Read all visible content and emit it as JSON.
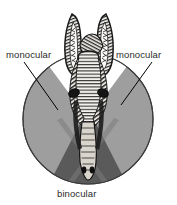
{
  "figure": {
    "type": "diagram"
  },
  "labels": {
    "monocular_left": "monocular",
    "monocular_right": "monocular",
    "binocular": "binocular"
  },
  "colors": {
    "background": "#ffffff",
    "monocular_zone": "#9e9e9e",
    "binocular_zone": "#5a5a5a",
    "outline": "#3a3a3a",
    "leader_line": "#000000",
    "label_text": "#2b2b2b",
    "head_ink": "#1a1a1a",
    "head_paper": "#f2f0ec"
  },
  "geometry": {
    "circle_center_x": 88,
    "circle_center_y": 119,
    "circle_radius": 65,
    "leader_left_from": [
      24,
      62
    ],
    "leader_left_to": [
      58,
      110
    ],
    "leader_right_from": [
      152,
      62
    ],
    "leader_right_to": [
      121,
      105
    ]
  }
}
